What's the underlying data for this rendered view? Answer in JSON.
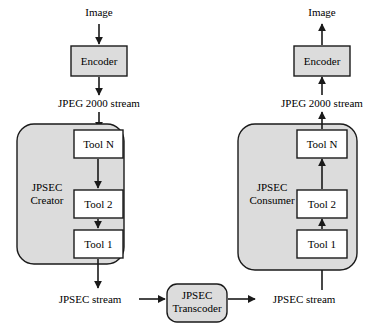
{
  "figure": {
    "type": "block-diagram",
    "colors": {
      "fill_gray": "#dcdcdc",
      "fill_white": "#ffffff",
      "stroke": "#1a1a1a",
      "background": "#ffffff"
    }
  },
  "left_chain": {
    "source_label": "Image",
    "encoder_label": "Encoder",
    "stream_label": "JPEG 2000 stream",
    "group_label": "JPSEC\nCreator",
    "tools": [
      {
        "label": "Tool N"
      },
      {
        "label": "Tool 2"
      },
      {
        "label": "Tool 1"
      }
    ],
    "output_label": "JPSEC stream"
  },
  "middle": {
    "transcoder_label": "JPSEC\nTranscoder"
  },
  "right_chain": {
    "sink_label": "Image",
    "encoder_label": "Encoder",
    "stream_label": "JPEG 2000 stream",
    "group_label": "JPSEC\nConsumer",
    "tools": [
      {
        "label": "Tool N"
      },
      {
        "label": "Tool 2"
      },
      {
        "label": "Tool 1"
      }
    ],
    "input_label": "JPSEC stream"
  }
}
